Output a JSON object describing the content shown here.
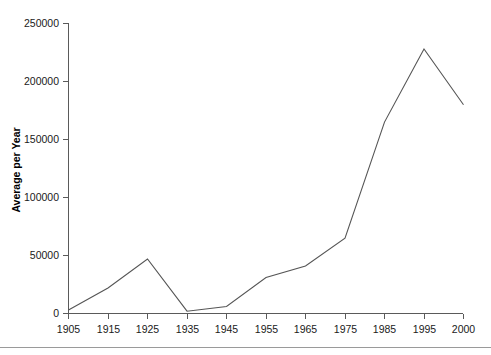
{
  "chart_data": {
    "type": "line",
    "title": "",
    "subtitle": "",
    "xlabel": "",
    "ylabel": "Average per Year",
    "categories": [
      "1905",
      "1915",
      "1925",
      "1935",
      "1945",
      "1955",
      "1965",
      "1975",
      "1985",
      "1995",
      "2000"
    ],
    "values": [
      3000,
      22000,
      47000,
      2000,
      6000,
      31000,
      41000,
      65000,
      165000,
      228000,
      180000
    ],
    "series": [
      {
        "name": "Average per Year",
        "values": [
          3000,
          22000,
          47000,
          2000,
          6000,
          31000,
          41000,
          65000,
          165000,
          228000,
          180000
        ],
        "color": "#555555"
      }
    ],
    "ylim": [
      0,
      250000
    ],
    "y_ticks": [
      0,
      50000,
      100000,
      150000,
      200000,
      250000
    ],
    "y_tick_labels": [
      "0",
      "50000",
      "100000",
      "150000",
      "200000",
      "250000"
    ],
    "x_tick_labels": [
      "1905",
      "1915",
      "1925",
      "1935",
      "1945",
      "1955",
      "1965",
      "1975",
      "1985",
      "1995",
      "2000"
    ],
    "grid": false,
    "legend": false,
    "legend_position": "none",
    "annotations": []
  },
  "axes": {
    "y_title": "Average per Year",
    "y_labels": [
      "250000",
      "200000",
      "150000",
      "100000",
      "50000",
      "0"
    ],
    "x_labels": [
      "1905",
      "1915",
      "1925",
      "1935",
      "1945",
      "1955",
      "1965",
      "1975",
      "1985",
      "1995",
      "2000"
    ]
  },
  "colors": {
    "line": "#555555",
    "axis": "#5a5a5a",
    "text": "#1a1a1a",
    "background": "#ffffff",
    "footer_rule": "#9a9a9a"
  }
}
